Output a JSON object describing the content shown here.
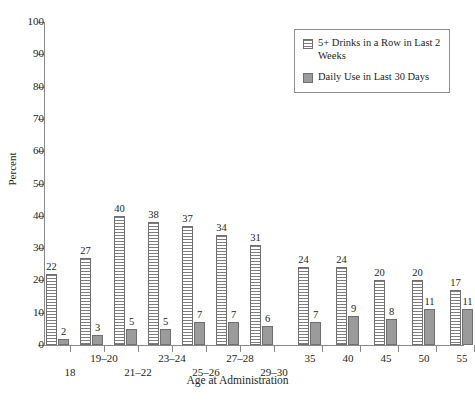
{
  "chart_data": {
    "type": "bar",
    "title": "",
    "xlabel": "Age at Administration",
    "ylabel": "Percent",
    "ylim": [
      0,
      100
    ],
    "yticks": [
      0,
      10,
      20,
      30,
      40,
      50,
      60,
      70,
      80,
      90,
      100
    ],
    "grid": false,
    "legend_position": "top-right",
    "categories": [
      "18",
      "19–20",
      "21–22",
      "23–24",
      "25–26",
      "27–28",
      "29–30",
      "35",
      "40",
      "45",
      "50",
      "55"
    ],
    "series": [
      {
        "name": "5+ Drinks in a Row in Last 2 Weeks",
        "values": [
          22,
          27,
          40,
          38,
          37,
          34,
          31,
          24,
          24,
          20,
          20,
          17
        ]
      },
      {
        "name": "Daily Use in Last 30 Days",
        "values": [
          2,
          3,
          5,
          5,
          7,
          7,
          6,
          7,
          9,
          8,
          11,
          11
        ]
      }
    ]
  },
  "axes": {
    "y_title": "Percent",
    "x_title": "Age at Administration",
    "y_tick_labels": [
      "100",
      "90",
      "80",
      "70",
      "60",
      "50",
      "40",
      "30",
      "20",
      "10",
      "0"
    ]
  },
  "legend": {
    "entries": [
      {
        "label": "5+ Drinks in a Row in Last 2 Weeks",
        "swatch": "hatched-bar-swatch"
      },
      {
        "label": "Daily Use in Last 30 Days",
        "swatch": "solid-bar-swatch"
      }
    ]
  },
  "x_labels": [
    {
      "text": "18",
      "row": "bot"
    },
    {
      "text": "19–20",
      "row": "top"
    },
    {
      "text": "21–22",
      "row": "bot"
    },
    {
      "text": "23–24",
      "row": "top"
    },
    {
      "text": "25–26",
      "row": "bot"
    },
    {
      "text": "27–28",
      "row": "top"
    },
    {
      "text": "29–30",
      "row": "bot"
    },
    {
      "text": "35",
      "row": "top"
    },
    {
      "text": "40",
      "row": "top"
    },
    {
      "text": "45",
      "row": "top"
    },
    {
      "text": "50",
      "row": "top"
    },
    {
      "text": "55",
      "row": "top"
    }
  ],
  "colors": {
    "axis": "#8a8a8a",
    "text": "#231f20",
    "hatch_fill": "#f3f3f3",
    "hatch_line": "#7d7d7d",
    "solid_fill": "#9b9b9b",
    "bar_stroke": "#6f6f6f"
  }
}
